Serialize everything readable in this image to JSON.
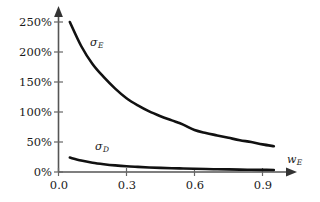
{
  "chart_data": {
    "type": "line",
    "title": "",
    "xlabel": "w_E",
    "ylabel": "",
    "xlim": [
      0.0,
      1.0
    ],
    "ylim": [
      0,
      2.75
    ],
    "grid": false,
    "legend_position": "inline-curve-labels",
    "x_ticks": [
      {
        "value": 0.0,
        "label": "0.0"
      },
      {
        "value": 0.3,
        "label": "0.3"
      },
      {
        "value": 0.6,
        "label": "0.6"
      },
      {
        "value": 0.9,
        "label": "0.9"
      }
    ],
    "y_ticks": [
      {
        "value": 0.0,
        "label": "0%"
      },
      {
        "value": 0.5,
        "label": "50%"
      },
      {
        "value": 1.0,
        "label": "100%"
      },
      {
        "value": 1.5,
        "label": "150%"
      },
      {
        "value": 2.0,
        "label": "200%"
      },
      {
        "value": 2.5,
        "label": "250%"
      }
    ],
    "series": [
      {
        "name": "sigma_E",
        "label": "σ",
        "label_sub": "E",
        "color": "#111111",
        "x": [
          0.05,
          0.1,
          0.15,
          0.2,
          0.25,
          0.3,
          0.35,
          0.4,
          0.45,
          0.5,
          0.55,
          0.6,
          0.65,
          0.7,
          0.75,
          0.8,
          0.85,
          0.9,
          0.95
        ],
        "values": [
          2.5,
          2.1,
          1.8,
          1.58,
          1.39,
          1.23,
          1.11,
          1.01,
          0.93,
          0.86,
          0.79,
          0.7,
          0.65,
          0.61,
          0.57,
          0.53,
          0.5,
          0.46,
          0.43
        ]
      },
      {
        "name": "sigma_D",
        "label": "σ",
        "label_sub": "D",
        "color": "#111111",
        "x": [
          0.05,
          0.1,
          0.15,
          0.2,
          0.25,
          0.3,
          0.35,
          0.4,
          0.45,
          0.5,
          0.55,
          0.6,
          0.65,
          0.7,
          0.75,
          0.8,
          0.85,
          0.9,
          0.95
        ],
        "values": [
          0.24,
          0.19,
          0.155,
          0.13,
          0.11,
          0.095,
          0.085,
          0.076,
          0.069,
          0.063,
          0.058,
          0.053,
          0.049,
          0.046,
          0.043,
          0.04,
          0.038,
          0.036,
          0.034
        ]
      }
    ],
    "annotations": [
      {
        "name": "sigma-E-curve-label",
        "text": "σ",
        "sub": "E",
        "x_px": 92,
        "y_px": 38
      },
      {
        "name": "sigma-D-curve-label",
        "text": "σ",
        "sub": "D",
        "x_px": 97,
        "y_px": 142
      },
      {
        "name": "x-axis-title",
        "text": "w",
        "sub": "E",
        "x_px": 288,
        "y_px": 155
      }
    ],
    "colors": {
      "curve": "#111111",
      "axis": "#555555",
      "text": "#1a1a1a",
      "background": "#ffffff"
    }
  }
}
